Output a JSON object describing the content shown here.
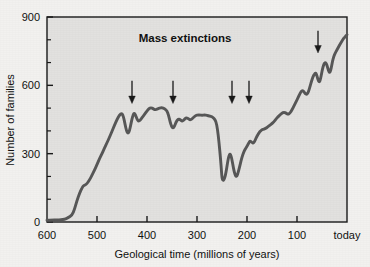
{
  "chart_data": {
    "type": "line",
    "title": "Mass extinctions",
    "xlabel": "Geological time (millions of years)",
    "ylabel": "Number of families",
    "xlim": [
      600,
      0
    ],
    "ylim": [
      0,
      900
    ],
    "x_ticks": [
      600,
      500,
      400,
      300,
      200,
      100,
      0
    ],
    "x_tick_labels": [
      "600",
      "500",
      "400",
      "300",
      "200",
      "100",
      "today"
    ],
    "y_ticks": [
      0,
      100,
      200,
      300,
      400,
      500,
      600,
      700,
      800,
      900
    ],
    "y_tick_labels": [
      "0",
      "",
      "",
      "300",
      "",
      "",
      "600",
      "",
      "",
      "900"
    ],
    "y_major_ticks": [
      0,
      300,
      600,
      900
    ],
    "grid": false,
    "legend": "none",
    "series": [
      {
        "name": "Number of marine animal families",
        "points": [
          [
            600,
            8
          ],
          [
            590,
            8
          ],
          [
            580,
            9
          ],
          [
            572,
            10
          ],
          [
            565,
            12
          ],
          [
            558,
            18
          ],
          [
            550,
            30
          ],
          [
            545,
            55
          ],
          [
            540,
            95
          ],
          [
            535,
            125
          ],
          [
            530,
            150
          ],
          [
            527,
            160
          ],
          [
            524,
            162
          ],
          [
            520,
            168
          ],
          [
            515,
            185
          ],
          [
            510,
            205
          ],
          [
            505,
            228
          ],
          [
            500,
            252
          ],
          [
            495,
            278
          ],
          [
            490,
            300
          ],
          [
            485,
            325
          ],
          [
            480,
            348
          ],
          [
            475,
            372
          ],
          [
            470,
            398
          ],
          [
            465,
            425
          ],
          [
            460,
            450
          ],
          [
            455,
            470
          ],
          [
            450,
            478
          ],
          [
            447,
            462
          ],
          [
            444,
            430
          ],
          [
            441,
            400
          ],
          [
            438,
            388
          ],
          [
            435,
            400
          ],
          [
            432,
            432
          ],
          [
            429,
            462
          ],
          [
            426,
            480
          ],
          [
            423,
            470
          ],
          [
            420,
            452
          ],
          [
            417,
            442
          ],
          [
            414,
            446
          ],
          [
            410,
            458
          ],
          [
            405,
            472
          ],
          [
            400,
            488
          ],
          [
            396,
            498
          ],
          [
            392,
            502
          ],
          [
            388,
            498
          ],
          [
            384,
            492
          ],
          [
            380,
            496
          ],
          [
            375,
            500
          ],
          [
            370,
            502
          ],
          [
            365,
            498
          ],
          [
            360,
            488
          ],
          [
            357,
            470
          ],
          [
            354,
            442
          ],
          [
            351,
            420
          ],
          [
            348,
            412
          ],
          [
            345,
            420
          ],
          [
            342,
            438
          ],
          [
            338,
            452
          ],
          [
            334,
            450
          ],
          [
            330,
            442
          ],
          [
            326,
            448
          ],
          [
            322,
            458
          ],
          [
            318,
            455
          ],
          [
            314,
            448
          ],
          [
            310,
            452
          ],
          [
            306,
            462
          ],
          [
            302,
            468
          ],
          [
            298,
            470
          ],
          [
            294,
            470
          ],
          [
            290,
            468
          ],
          [
            285,
            470
          ],
          [
            280,
            468
          ],
          [
            275,
            465
          ],
          [
            270,
            462
          ],
          [
            266,
            455
          ],
          [
            262,
            442
          ],
          [
            259,
            408
          ],
          [
            256,
            350
          ],
          [
            253,
            280
          ],
          [
            251,
            222
          ],
          [
            250,
            192
          ],
          [
            248,
            182
          ],
          [
            246,
            186
          ],
          [
            244,
            198
          ],
          [
            242,
            218
          ],
          [
            240,
            245
          ],
          [
            238,
            272
          ],
          [
            236,
            292
          ],
          [
            234,
            300
          ],
          [
            232,
            292
          ],
          [
            230,
            272
          ],
          [
            228,
            248
          ],
          [
            226,
            225
          ],
          [
            224,
            208
          ],
          [
            222,
            200
          ],
          [
            220,
            202
          ],
          [
            218,
            215
          ],
          [
            215,
            240
          ],
          [
            212,
            268
          ],
          [
            209,
            292
          ],
          [
            206,
            310
          ],
          [
            203,
            322
          ],
          [
            200,
            332
          ],
          [
            197,
            345
          ],
          [
            194,
            356
          ],
          [
            191,
            352
          ],
          [
            188,
            345
          ],
          [
            185,
            352
          ],
          [
            182,
            368
          ],
          [
            178,
            385
          ],
          [
            174,
            398
          ],
          [
            170,
            405
          ],
          [
            166,
            408
          ],
          [
            162,
            412
          ],
          [
            158,
            418
          ],
          [
            154,
            425
          ],
          [
            150,
            432
          ],
          [
            146,
            440
          ],
          [
            142,
            452
          ],
          [
            138,
            462
          ],
          [
            134,
            470
          ],
          [
            130,
            478
          ],
          [
            126,
            482
          ],
          [
            122,
            478
          ],
          [
            118,
            472
          ],
          [
            114,
            478
          ],
          [
            110,
            492
          ],
          [
            106,
            510
          ],
          [
            102,
            528
          ],
          [
            98,
            545
          ],
          [
            95,
            560
          ],
          [
            92,
            572
          ],
          [
            89,
            578
          ],
          [
            86,
            572
          ],
          [
            83,
            562
          ],
          [
            80,
            560
          ],
          [
            77,
            572
          ],
          [
            74,
            595
          ],
          [
            71,
            618
          ],
          [
            68,
            638
          ],
          [
            65,
            650
          ],
          [
            63,
            655
          ],
          [
            61,
            648
          ],
          [
            59,
            632
          ],
          [
            57,
            618
          ],
          [
            55,
            615
          ],
          [
            53,
            628
          ],
          [
            51,
            650
          ],
          [
            49,
            672
          ],
          [
            47,
            688
          ],
          [
            45,
            698
          ],
          [
            43,
            700
          ],
          [
            41,
            694
          ],
          [
            39,
            680
          ],
          [
            37,
            665
          ],
          [
            35,
            655
          ],
          [
            33,
            662
          ],
          [
            31,
            682
          ],
          [
            29,
            705
          ],
          [
            27,
            722
          ],
          [
            25,
            735
          ],
          [
            22,
            748
          ],
          [
            19,
            760
          ],
          [
            16,
            772
          ],
          [
            13,
            784
          ],
          [
            10,
            795
          ],
          [
            7,
            805
          ],
          [
            4,
            812
          ],
          [
            2,
            818
          ],
          [
            0,
            822
          ]
        ]
      }
    ],
    "annotations": [
      {
        "label": "mass-extinction-arrow",
        "x": 430,
        "y_top": 620,
        "y_tip": 520
      },
      {
        "label": "mass-extinction-arrow",
        "x": 348,
        "y_top": 620,
        "y_tip": 520
      },
      {
        "label": "mass-extinction-arrow",
        "x": 230,
        "y_top": 620,
        "y_tip": 520
      },
      {
        "label": "mass-extinction-arrow",
        "x": 196,
        "y_top": 620,
        "y_tip": 520
      },
      {
        "label": "mass-extinction-arrow",
        "x": 58,
        "y_top": 840,
        "y_tip": 742
      }
    ]
  },
  "colors": {
    "page_background": "#f2f1ef",
    "plot_background": "#e2e1df",
    "curve": "#575757",
    "axis": "#1a1a1a",
    "text": "#111111",
    "arrow": "#1a1a1a"
  }
}
